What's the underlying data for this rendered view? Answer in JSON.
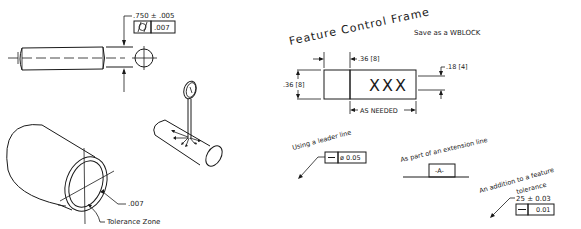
{
  "left_panel": {
    "shaft": {
      "dimension": ".750 ± .005",
      "fcf_symbol": "cylindricity-symbol",
      "fcf_tolerance": ".007"
    },
    "dial_indicator": {
      "description": "dial indicator on cylinder"
    },
    "tube": {
      "zone_value": ".007",
      "zone_label": "Tolerance Zone"
    }
  },
  "right_panel": {
    "title": "Feature Control Frame",
    "note": "Save as a WBLOCK",
    "frame": {
      "height_dim": ".36 [8]",
      "first_cell_width_dim": ".36 [8]",
      "text_height_dim": ".18 [4]",
      "content": "XXX",
      "length_note": "AS NEEDED"
    },
    "examples": {
      "leader": {
        "label": "Using a leader line",
        "symbol": "straightness-symbol",
        "tolerance": "ø 0.05"
      },
      "extension": {
        "label": "As part of an extension line",
        "datum": "-A-"
      },
      "feature": {
        "label_line1": "An addition to a feature",
        "label_line2": "tolerance",
        "dimension": "25 ± 0.03",
        "symbol": "straightness-symbol",
        "tolerance": "0.01"
      }
    }
  }
}
